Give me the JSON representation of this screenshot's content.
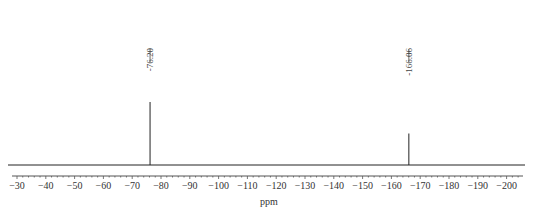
{
  "chart_data": {
    "type": "line",
    "title": "",
    "xlabel": "ppm",
    "ylabel": "",
    "xlim": [
      -27,
      -206
    ],
    "x_axis_reversed": true,
    "grid": false,
    "tick_labels": [
      "-30",
      "-40",
      "-50",
      "-60",
      "-70",
      "-80",
      "-90",
      "-100",
      "-110",
      "-120",
      "-130",
      "-140",
      "-150",
      "-160",
      "-170",
      "-180",
      "-190",
      "-200"
    ],
    "tick_values": [
      -30,
      -40,
      -50,
      -60,
      -70,
      -80,
      -90,
      -100,
      -110,
      -120,
      -130,
      -140,
      -150,
      -160,
      -170,
      -180,
      -190,
      -200
    ],
    "peaks": [
      {
        "label": "76.20",
        "ppm": -76.2,
        "relative_height": 1.0
      },
      {
        "label": "166.06",
        "ppm": -166.06,
        "relative_height": 0.5
      }
    ],
    "series": [
      {
        "name": "19F NMR spectrum",
        "x": [
          -27,
          -76.2,
          -166.06,
          -206
        ],
        "y": [
          0,
          1.0,
          0.5,
          0
        ]
      }
    ]
  }
}
